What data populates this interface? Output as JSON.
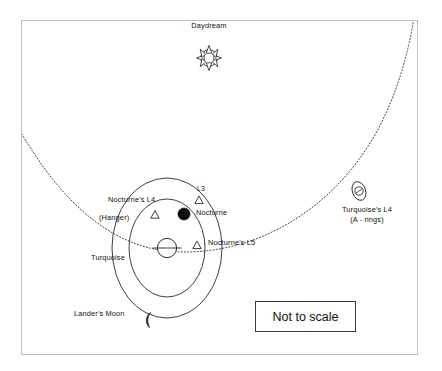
{
  "diagram": {
    "frame": {
      "stroke": "#b9b9b9",
      "x": 21,
      "y": 20,
      "width": 397,
      "height": 335
    },
    "background": "#ffffff",
    "ink": "#1a1a1a",
    "bodies": [
      {
        "id": "daydream",
        "label": "Daydream",
        "icon": "sun-icon",
        "label_x": 185,
        "label_y": 22,
        "cx": 209,
        "cy": 58,
        "r": 8.5,
        "rays": 8
      },
      {
        "id": "turquoise",
        "label": "Turquoise",
        "icon": "ringed-planet-icon",
        "label_x": 92,
        "label_y": 255,
        "cx": 167,
        "cy": 248,
        "r": 10
      },
      {
        "id": "nocturne",
        "label": "Nocturne",
        "icon": "filled-moon-icon",
        "label_x": 197,
        "label_y": 211,
        "cx": 184,
        "cy": 214,
        "r": 6.2
      },
      {
        "id": "landers-moon",
        "label": "Lander's Moon",
        "icon": "crescent-moon-icon",
        "label_x": 74,
        "label_y": 311,
        "cx": 152,
        "cy": 319,
        "r": 6
      },
      {
        "id": "turquoise-l4-rings",
        "label": "Turquoise's L4",
        "sublabel": "(A - rings)",
        "icon": "ringed-body-icon",
        "label_x": 350,
        "label_y": 208,
        "cx": 359,
        "cy": 191,
        "r": 4.2
      }
    ],
    "lagrange_points": [
      {
        "id": "nocturne-l4",
        "label": "Nocturne's L4",
        "sublabel": "(Hanger)",
        "marker": "triangle",
        "label_x": 108,
        "label_y": 199,
        "sublabel_x": 100,
        "sublabel_y": 216,
        "mx": 155,
        "my": 215
      },
      {
        "id": "nocturne-l3",
        "label": "L3",
        "marker": "triangle",
        "label_x": 198,
        "label_y": 186,
        "mx": 199,
        "my": 200
      },
      {
        "id": "nocturne-l5",
        "label": "Nocturne's L5",
        "marker": "triangle",
        "label_x": 205,
        "label_y": 240,
        "mx": 197,
        "my": 245
      }
    ],
    "orbits": [
      {
        "id": "turquoise-orbit-around-daydream",
        "style": "dotted",
        "description": "Turquoise's orbit about Daydream"
      },
      {
        "id": "nocturne-orbit",
        "style": "solid",
        "description": "Nocturne's orbit about Turquoise"
      },
      {
        "id": "landers-moon-orbit",
        "style": "solid",
        "description": "Lander's Moon orbit about Turquoise"
      }
    ],
    "note": {
      "text": "Not to scale",
      "x": 255,
      "y": 301,
      "width": 101,
      "height": 31
    }
  }
}
